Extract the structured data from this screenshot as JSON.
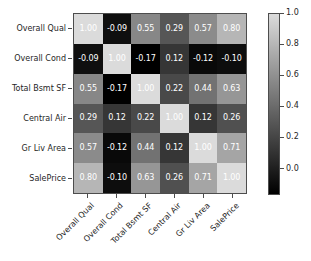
{
  "chart_data": {
    "type": "heatmap",
    "title": "",
    "xlabel": "",
    "ylabel": "",
    "categories": [
      "Overall Qual",
      "Overall Cond",
      "Total Bsmt SF",
      "Central Air",
      "Gr Liv Area",
      "SalePrice"
    ],
    "x_tick_labels": [
      "Overall Qual",
      "Overall Cond",
      "Total Bsmt SF",
      "Central Air",
      "Gr Liv Area",
      "SalePrice"
    ],
    "y_tick_labels": [
      "Overall Qual",
      "Overall Cond",
      "Total Bsmt SF",
      "Central Air",
      "Gr Liv Area",
      "SalePrice"
    ],
    "x_tick_rotation": -45,
    "grid": false,
    "annotate": true,
    "colormap": "gray",
    "vmin": -0.17,
    "vmax": 1.0,
    "colorbar": {
      "position": "right",
      "orientation": "vertical",
      "ticks": [
        0.0,
        0.2,
        0.4,
        0.6,
        0.8,
        1.0
      ],
      "tick_labels": [
        "0.0",
        "0.2",
        "0.4",
        "0.6",
        "0.8",
        "1.0"
      ],
      "low_color": "#000000",
      "high_color": "#dbdbdb"
    },
    "rows": [
      {
        "label": "Overall Qual",
        "values": [
          1.0,
          -0.09,
          0.55,
          0.29,
          0.57,
          0.8
        ],
        "text": [
          "1.00",
          "-0.09",
          "0.55",
          "0.29",
          "0.57",
          "0.80"
        ]
      },
      {
        "label": "Overall Cond",
        "values": [
          -0.09,
          1.0,
          -0.17,
          0.12,
          -0.12,
          -0.1
        ],
        "text": [
          "-0.09",
          "1.00",
          "-0.17",
          "0.12",
          "-0.12",
          "-0.10"
        ]
      },
      {
        "label": "Total Bsmt SF",
        "values": [
          0.55,
          -0.17,
          1.0,
          0.22,
          0.44,
          0.63
        ],
        "text": [
          "0.55",
          "-0.17",
          "1.00",
          "0.22",
          "0.44",
          "0.63"
        ]
      },
      {
        "label": "Central Air",
        "values": [
          0.29,
          0.12,
          0.22,
          1.0,
          0.12,
          0.26
        ],
        "text": [
          "0.29",
          "0.12",
          "0.22",
          "1.00",
          "0.12",
          "0.26"
        ]
      },
      {
        "label": "Gr Liv Area",
        "values": [
          0.57,
          -0.12,
          0.44,
          0.12,
          1.0,
          0.71
        ],
        "text": [
          "0.57",
          "-0.12",
          "0.44",
          "0.12",
          "1.00",
          "0.71"
        ]
      },
      {
        "label": "SalePrice",
        "values": [
          0.8,
          -0.1,
          0.63,
          0.26,
          0.71,
          1.0
        ],
        "text": [
          "0.80",
          "-0.10",
          "0.63",
          "0.26",
          "0.71",
          "1.00"
        ]
      }
    ]
  },
  "style": {
    "background": "#ffffff",
    "text_color": "#262626",
    "spine_color": "#4d4d4d",
    "annotation_color": "#ffffff"
  }
}
